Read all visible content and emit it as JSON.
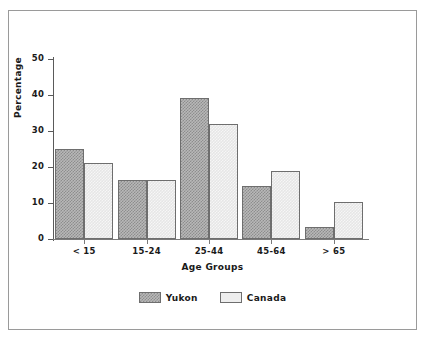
{
  "chart_data": {
    "type": "bar",
    "title": "",
    "subtitle": "",
    "xlabel": "Age Groups",
    "ylabel": "Percentage",
    "categories": [
      "< 15",
      "15-24",
      "25-44",
      "45-64",
      "> 65"
    ],
    "series": [
      {
        "name": "Yukon",
        "values": [
          25.0,
          16.5,
          39.3,
          14.8,
          3.3
        ]
      },
      {
        "name": "Canada",
        "values": [
          21.2,
          16.3,
          32.0,
          19.0,
          10.3
        ]
      }
    ],
    "ylim": [
      0,
      50
    ],
    "yticks": [
      0,
      10,
      20,
      30,
      40,
      50
    ],
    "ytick_labels": [
      "0",
      "10",
      "20",
      "30",
      "40",
      "50"
    ],
    "grid": false,
    "legend_position": "bottom-center",
    "legend_entries": [
      {
        "label": "Yukon",
        "swatch": "crosshatch-gray"
      },
      {
        "label": "Canada",
        "swatch": "light-gray"
      }
    ],
    "colors": {
      "yukon_fill": "#b8b8b8",
      "yukon_hatch": "#8d8d8d",
      "canada_fill": "#e6e6e6",
      "bar_outline": "#6e6e6e",
      "axis": "#5a5a5a",
      "text": "#1a1a1a",
      "frame": "#9a9a9a",
      "background": "#ffffff"
    }
  }
}
